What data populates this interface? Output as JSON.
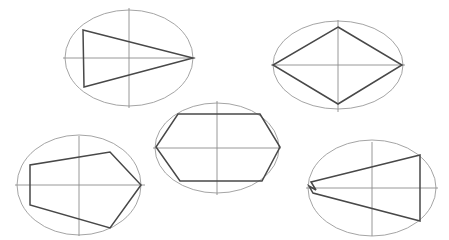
{
  "figure": {
    "background_color": "#ffffff",
    "width": 449,
    "height": 240,
    "ellipse_stroke_color": "#9a9a9a",
    "axis_stroke_color": "#8d8d8d",
    "polygon_stroke_color": "#484848"
  },
  "chart_data": {
    "type": "diagram",
    "xlabel": "",
    "ylabel": "",
    "grid": false,
    "legend": "none",
    "panel_count": 5,
    "panels": [
      {
        "id": "panel-top-left",
        "label": "Triangle in ellipse",
        "ellipse": {
          "cx": 129,
          "cy": 58,
          "rx": 64,
          "ry": 48
        },
        "axes": {
          "horizontal": {
            "x1": 63,
            "y1": 58,
            "x2": 195,
            "y2": 58
          },
          "vertical": {
            "x1": 129,
            "y1": 8,
            "x2": 129,
            "y2": 108
          }
        },
        "polygon_vertex_count": 3,
        "polygon_points": "83,30 193,58 84,87"
      },
      {
        "id": "panel-top-right",
        "label": "Rhombus in ellipse",
        "ellipse": {
          "cx": 338,
          "cy": 65,
          "rx": 65,
          "ry": 44
        },
        "axes": {
          "horizontal": {
            "x1": 271,
            "y1": 65,
            "x2": 405,
            "y2": 65
          },
          "vertical": {
            "x1": 338,
            "y1": 20,
            "x2": 338,
            "y2": 112
          }
        },
        "polygon_vertex_count": 4,
        "polygon_points": "338,27 402,65 338,104 273,65"
      },
      {
        "id": "panel-middle",
        "label": "Hexagon in ellipse",
        "ellipse": {
          "cx": 217,
          "cy": 148,
          "rx": 62,
          "ry": 45
        },
        "axes": {
          "horizontal": {
            "x1": 153,
            "y1": 148,
            "x2": 281,
            "y2": 148
          },
          "vertical": {
            "x1": 217,
            "y1": 101,
            "x2": 217,
            "y2": 195
          }
        },
        "polygon_vertex_count": 6,
        "polygon_points": "178,114 260,114 280,147 262,181 180,181 156,147"
      },
      {
        "id": "panel-bottom-left",
        "label": "Heptagon in ellipse",
        "ellipse": {
          "cx": 79,
          "cy": 185,
          "rx": 62,
          "ry": 50
        },
        "axes": {
          "horizontal": {
            "x1": 15,
            "y1": 185,
            "x2": 145,
            "y2": 185
          },
          "vertical": {
            "x1": 79,
            "y1": 136,
            "x2": 79,
            "y2": 236
          }
        },
        "polygon_vertex_count": 6,
        "polygon_points": "30,165 30,205 110,228 141,185 110,152 30,165"
      },
      {
        "id": "panel-bottom-right",
        "label": "Degenerate polygon in ellipse",
        "ellipse": {
          "cx": 372,
          "cy": 188,
          "rx": 64,
          "ry": 48
        },
        "axes": {
          "horizontal": {
            "x1": 306,
            "y1": 188,
            "x2": 438,
            "y2": 188
          },
          "vertical": {
            "x1": 372,
            "y1": 142,
            "x2": 372,
            "y2": 236
          }
        },
        "polygon_vertex_count": 6,
        "polygon_points": "311,182 420,155 420,221 313,193 309,186 316,190"
      }
    ]
  }
}
